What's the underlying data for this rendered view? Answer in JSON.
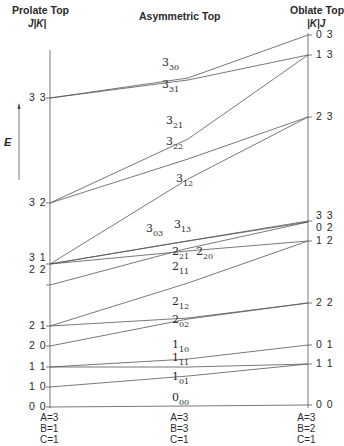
{
  "headers": {
    "left_title": "Prolate Top",
    "left_sub": "J|K|",
    "center_title": "Asymmetric Top",
    "right_title": "Oblate Top",
    "right_sub": "|K|J"
  },
  "axis": {
    "energy_label": "E"
  },
  "left_levels": [
    {
      "label": "3 3",
      "y": 98
    },
    {
      "label": "3 2",
      "y": 203
    },
    {
      "label": "3 1",
      "y": 258
    },
    {
      "label": "2 2",
      "y": 270
    },
    {
      "label": "2 1",
      "y": 326
    },
    {
      "label": "2 0",
      "y": 346
    },
    {
      "label": "1 1",
      "y": 367
    },
    {
      "label": "1 0",
      "y": 387
    },
    {
      "label": "0 0",
      "y": 407
    }
  ],
  "right_levels": [
    {
      "label": "0 3",
      "y": 35
    },
    {
      "label": "1 3",
      "y": 55
    },
    {
      "label": "2 3",
      "y": 117
    },
    {
      "label": "3 3",
      "y": 216
    },
    {
      "label": "0 2",
      "y": 228
    },
    {
      "label": "1 2",
      "y": 241
    },
    {
      "label": "2 2",
      "y": 303
    },
    {
      "label": "0 1",
      "y": 345
    },
    {
      "label": "1 1",
      "y": 364
    },
    {
      "label": "0 0",
      "y": 405
    }
  ],
  "asym_levels": [
    {
      "j": "3",
      "sub": "30",
      "x": 162,
      "y": 64
    },
    {
      "j": "3",
      "sub": "31",
      "x": 162,
      "y": 86
    },
    {
      "j": "3",
      "sub": "21",
      "x": 166,
      "y": 122
    },
    {
      "j": "3",
      "sub": "22",
      "x": 166,
      "y": 143
    },
    {
      "j": "3",
      "sub": "12",
      "x": 176,
      "y": 180
    },
    {
      "j": "3",
      "sub": "03",
      "x": 146,
      "y": 230
    },
    {
      "j": "3",
      "sub": "13",
      "x": 174,
      "y": 226
    },
    {
      "j": "2",
      "sub": "21",
      "x": 172,
      "y": 253
    },
    {
      "j": "2",
      "sub": "20",
      "x": 196,
      "y": 253
    },
    {
      "j": "2",
      "sub": "11",
      "x": 172,
      "y": 268
    },
    {
      "j": "2",
      "sub": "12",
      "x": 172,
      "y": 303
    },
    {
      "j": "2",
      "sub": "02",
      "x": 172,
      "y": 321
    },
    {
      "j": "1",
      "sub": "10",
      "x": 172,
      "y": 346
    },
    {
      "j": "1",
      "sub": "11",
      "x": 172,
      "y": 359
    },
    {
      "j": "1",
      "sub": "01",
      "x": 172,
      "y": 378
    },
    {
      "j": "0",
      "sub": "00",
      "x": 172,
      "y": 399
    }
  ],
  "params": {
    "left": [
      "A=3",
      "B=1",
      "C=1"
    ],
    "center": [
      "A=3",
      "B=3",
      "C=1"
    ],
    "right": [
      "A=3",
      "B=2",
      "C=1"
    ]
  },
  "correlation_lines": [
    {
      "name": "3_30",
      "points": [
        [
          50,
          98
        ],
        [
          188,
          78
        ],
        [
          308,
          35
        ]
      ]
    },
    {
      "name": "3_31",
      "points": [
        [
          50,
          98
        ],
        [
          188,
          80
        ],
        [
          308,
          55
        ]
      ]
    },
    {
      "name": "3_21",
      "points": [
        [
          50,
          203
        ],
        [
          188,
          139
        ],
        [
          308,
          55
        ]
      ]
    },
    {
      "name": "3_22",
      "points": [
        [
          50,
          203
        ],
        [
          188,
          159
        ],
        [
          308,
          117
        ]
      ]
    },
    {
      "name": "3_12",
      "points": [
        [
          50,
          264
        ],
        [
          188,
          179
        ],
        [
          308,
          117
        ]
      ]
    },
    {
      "name": "3_03",
      "points": [
        [
          50,
          264
        ],
        [
          175,
          243
        ],
        [
          308,
          221
        ]
      ]
    },
    {
      "name": "3_13",
      "points": [
        [
          50,
          264
        ],
        [
          188,
          241
        ],
        [
          308,
          222
        ]
      ]
    },
    {
      "name": "2_21",
      "points": [
        [
          50,
          264
        ],
        [
          188,
          251
        ],
        [
          308,
          241
        ]
      ]
    },
    {
      "name": "2_20",
      "points": [
        [
          50,
          285
        ],
        [
          185,
          249
        ],
        [
          308,
          222
        ]
      ]
    },
    {
      "name": "2_11",
      "points": [
        [
          50,
          326
        ],
        [
          188,
          283
        ],
        [
          308,
          241
        ]
      ]
    },
    {
      "name": "2_12",
      "points": [
        [
          50,
          326
        ],
        [
          188,
          318
        ],
        [
          308,
          303
        ]
      ]
    },
    {
      "name": "2_02",
      "points": [
        [
          50,
          346
        ],
        [
          188,
          319
        ],
        [
          308,
          303
        ]
      ]
    },
    {
      "name": "1_10",
      "points": [
        [
          50,
          367
        ],
        [
          188,
          359
        ],
        [
          308,
          345
        ]
      ]
    },
    {
      "name": "1_11",
      "points": [
        [
          50,
          367
        ],
        [
          188,
          367
        ],
        [
          308,
          364
        ]
      ]
    },
    {
      "name": "1_01",
      "points": [
        [
          50,
          387
        ],
        [
          188,
          376
        ],
        [
          308,
          364
        ]
      ]
    },
    {
      "name": "0_00",
      "points": [
        [
          50,
          407
        ],
        [
          188,
          406
        ],
        [
          308,
          405
        ]
      ]
    }
  ]
}
